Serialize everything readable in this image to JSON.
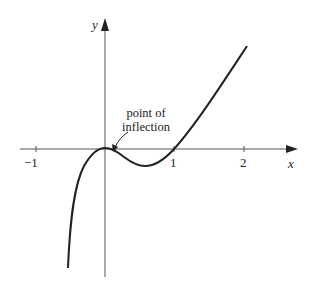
{
  "figure": {
    "x_axis_label": "x",
    "y_axis_label": "y",
    "ticks": [
      {
        "value": -1,
        "label": "−1"
      },
      {
        "value": 1,
        "label": "1"
      },
      {
        "value": 2,
        "label": "2"
      }
    ],
    "annotation": {
      "line1": "point of",
      "line2": "inflection"
    },
    "curve": {
      "description": "cubic curve with horizontal tangent at origin, local minimum near x≈0.6, crossing x-axis at x=1",
      "color": "#222222"
    }
  }
}
